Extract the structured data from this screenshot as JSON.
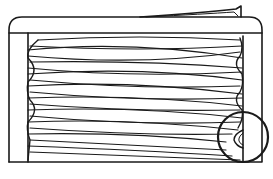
{
  "figure": {
    "type": "line-drawing",
    "stroke_color": "#1a1a1a",
    "background": "#ffffff",
    "thread_turns": 4,
    "detail_callout": "circle-detail-lower-right"
  }
}
